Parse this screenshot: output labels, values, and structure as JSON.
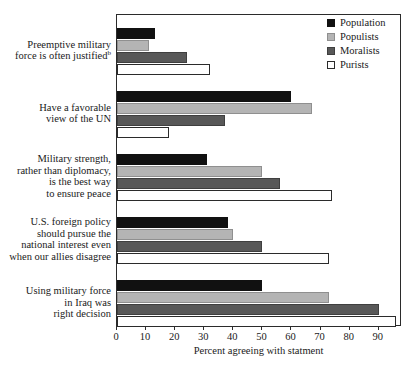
{
  "chart_data": {
    "type": "bar",
    "orientation": "horizontal",
    "title": "",
    "xlabel": "Percent agreeing with statment",
    "ylabel": "",
    "xlim": [
      0,
      98
    ],
    "xticks": [
      0,
      10,
      20,
      30,
      40,
      50,
      60,
      70,
      80,
      90
    ],
    "xticklabels": [
      "0",
      "10",
      "20",
      "30",
      "40",
      "50",
      "60",
      "70",
      "80",
      "90"
    ],
    "grid": false,
    "legend_position": "top-right",
    "categories": [
      "Preemptive military force is often justified",
      "Have a favorable view of the UN",
      "Military strength, rather than diplomacy, is the best way to ensure peace",
      "U.S. foreign policy should pursue the national interest even when our allies disagree",
      "Using military force in Iraq was right decision"
    ],
    "category_lines": [
      [
        "Preemptive military",
        "force is often justified"
      ],
      [
        "Have a favorable",
        "view of the UN"
      ],
      [
        "Military strength,",
        "rather than diplomacy,",
        "is the best way",
        "to ensure peace"
      ],
      [
        "U.S. foreign policy",
        "should pursue the",
        "national interest even",
        "when our allies disagree"
      ],
      [
        "Using military force",
        "in Iraq was",
        "right decision"
      ]
    ],
    "category_footnotes": [
      "b",
      "",
      "",
      "",
      ""
    ],
    "series": [
      {
        "name": "Population",
        "color": "#111111",
        "values": [
          13,
          60,
          31,
          38,
          50
        ]
      },
      {
        "name": "Populists",
        "color": "#b4b4b4",
        "values": [
          11,
          67,
          50,
          40,
          73
        ]
      },
      {
        "name": "Moralists",
        "color": "#585858",
        "values": [
          24,
          37,
          56,
          50,
          90
        ]
      },
      {
        "name": "Purists",
        "color": "#ffffff",
        "values": [
          32,
          18,
          74,
          73,
          96
        ]
      }
    ]
  },
  "legend": {
    "items": [
      {
        "label": "Population",
        "series_key": "series-population"
      },
      {
        "label": "Populists",
        "series_key": "series-populists"
      },
      {
        "label": "Moralists",
        "series_key": "series-moralists"
      },
      {
        "label": "Purists",
        "series_key": "series-purists"
      }
    ]
  }
}
